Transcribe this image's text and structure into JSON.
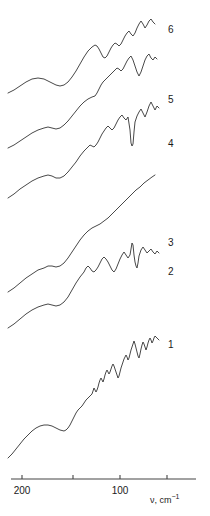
{
  "figure": {
    "background_color": "#ffffff",
    "line_color": "#333333",
    "text_color": "#1a1a1a"
  },
  "axis": {
    "title_main": "ν, cm",
    "title_exponent": "−1",
    "title_x": 150,
    "title_y": 496,
    "line_y": 479,
    "line_x_start": 11,
    "line_x_end": 196,
    "ticks": [
      {
        "label": "200",
        "x": 22,
        "value": 200
      },
      {
        "label": "",
        "x": 73,
        "value": 150
      },
      {
        "label": "100",
        "x": 120,
        "value": 100
      },
      {
        "label": "",
        "x": 167,
        "value": 50
      }
    ],
    "tick_label_y": 486,
    "direction": "decreasing-right"
  },
  "curve_labels": [
    {
      "text": "6",
      "x": 168,
      "y": 25
    },
    {
      "text": "5",
      "x": 168,
      "y": 95
    },
    {
      "text": "4",
      "x": 168,
      "y": 139
    },
    {
      "text": "3",
      "x": 168,
      "y": 238
    },
    {
      "text": "2",
      "x": 168,
      "y": 267
    },
    {
      "text": "1",
      "x": 168,
      "y": 340
    }
  ],
  "chart_data": {
    "type": "line",
    "title": "",
    "xlabel": "ν, cm−1",
    "ylabel": "",
    "xlim": [
      210,
      38
    ],
    "grid": false,
    "legend": "right-of-curve-end",
    "note": "Six vertically offset Raman/far-IR spectra, intensity in arbitrary units; x axis wavenumber decreasing to the right.",
    "series": [
      {
        "name": "6",
        "label": "6",
        "points": "8,93 14,90 20,86 26,82 32,79 38,78 44,79 50,82 56,85 60,86 64,85 68,82 72,77 76,71 80,64 84,57 88,51 92,47 95,45 97,46 99,49 101,53 103,57 105,58 107,56 109,52 111,48 113,45 115,43 117,44 119,46 121,44 123,40 125,36 127,33 129,31 131,34 133,36 135,33 137,28 139,24 141,21 143,24 145,28 147,25 149,21 151,19 153,22 155,24"
      },
      {
        "name": "5",
        "label": "5",
        "points": "8,148 14,145 20,141 26,137 32,133 38,130 44,128 48,127 52,128 56,129 60,128 64,125 68,121 72,116 76,111 80,106 84,102 88,99 92,97 95,96 97,93 99,89 101,85 103,82 105,80 107,78 109,76 111,74 113,72 115,70 117,68 119,69 121,71 123,69 125,65 127,61 129,58 131,56 133,60 135,66 137,72 139,76 141,72 143,66 145,60 147,56 149,54 151,58 153,60 155,57 157,59"
      },
      {
        "name": "4",
        "label": "4",
        "points": "8,198 14,194 20,189 26,185 32,181 38,178 44,176 48,175 52,176 56,178 60,178 64,176 68,172 72,167 76,162 80,156 84,151 88,147 90,145 92,146 94,147 96,145 98,142 100,138 102,134 104,131 106,128 108,126 110,128 112,130 114,128 116,124 118,120 120,117 122,115 124,118 126,120 128,117 130,130 131,143 132,146 133,144 134,132 135,122 137,116 139,112 141,109 143,113 145,117 147,112 149,106 151,102 153,106 155,110 157,106 159,108"
      },
      {
        "name": "3",
        "label": "3",
        "points": "8,292 14,288 20,283 26,278 32,274 38,270 44,268 48,266 52,266 56,267 60,266 64,263 68,258 72,252 76,246 80,240 84,235 88,231 92,228 96,226 100,224 104,221 108,218 112,214 116,210 120,206 124,202 128,198 132,194 136,190 140,187 144,183 148,180 152,177 155,175"
      },
      {
        "name": "2",
        "label": "2",
        "points": "8,328 14,324 20,319 26,314 32,310 38,307 44,305 48,304 52,305 56,306 60,305 64,302 68,297 72,290 76,283 80,277 84,272 86,268 88,266 90,268 92,271 94,272 96,270 98,267 100,263 102,259 104,257 106,259 108,262 110,266 112,270 114,272 116,269 118,264 120,259 122,255 124,252 126,255 128,258 130,255 131,249 132,243 133,245 134,255 135,262 136,266 137,268 138,263 139,256 141,250 143,247 145,250 147,253 149,251 151,249 153,252 155,254 157,251 159,253"
      },
      {
        "name": "1",
        "label": "1",
        "points": "8,458 12,454 16,449 20,444 24,439 28,435 32,431 36,428 40,426 44,425 48,425 52,426 56,428 60,430 64,431 66,430 68,428 70,425 72,421 74,417 76,413 78,410 80,408 82,406 84,403 86,400 88,398 90,396 92,394 93,391 94,388 95,390 96,392 97,390 98,387 99,383 100,380 101,378 102,380 103,382 104,379 105,375 106,372 107,370 108,372 109,374 110,372 111,369 112,366 113,364 114,366 115,369 116,372 117,375 118,378 119,376 120,372 121,368 122,365 123,362 124,359 125,357 126,355 127,357 128,360 129,358 130,354 131,350 132,347 133,344 134,341 135,344 136,348 137,352 138,356 139,358 140,354 141,349 142,345 143,342 144,344 145,347 146,350 147,347 148,343 149,340 150,338 151,340 152,343 153,341 154,338 155,336 157,338 159,340"
      }
    ]
  }
}
